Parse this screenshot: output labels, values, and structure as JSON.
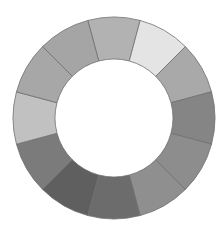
{
  "diagram": {
    "type": "color-wheel-donut",
    "segment_count": 12,
    "center": [
      114,
      118
    ],
    "outer_radius": 101,
    "inner_radius": 59,
    "start_angle_deg": -105,
    "stroke_color": "#707070",
    "segments": [
      {
        "index": 0,
        "fill": "#b2b2b2"
      },
      {
        "index": 1,
        "fill": "#e4e4e4"
      },
      {
        "index": 2,
        "fill": "#a9a9a9"
      },
      {
        "index": 3,
        "fill": "#858585"
      },
      {
        "index": 4,
        "fill": "#8d8d8d"
      },
      {
        "index": 5,
        "fill": "#8f8f8f"
      },
      {
        "index": 6,
        "fill": "#6c6c6c"
      },
      {
        "index": 7,
        "fill": "#5f5f5f"
      },
      {
        "index": 8,
        "fill": "#7b7b7b"
      },
      {
        "index": 9,
        "fill": "#c1c1c1"
      },
      {
        "index": 10,
        "fill": "#a7a7a7"
      },
      {
        "index": 11,
        "fill": "#a5a5a5"
      }
    ]
  }
}
